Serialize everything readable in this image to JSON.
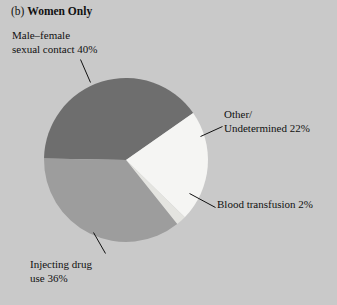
{
  "figure": {
    "panel_tag": "(b)",
    "title": "Women Only",
    "background_color": "#c9c9c9"
  },
  "chart_data": {
    "type": "pie",
    "title": "(b) Women Only",
    "xlabel": "",
    "ylabel": "",
    "legend_position": "none",
    "grid": false,
    "units": "percent",
    "total": 100,
    "categories": [
      "Male–female sexual contact",
      "Other/Undetermined",
      "Blood transfusion",
      "Injecting drug use"
    ],
    "values": [
      40,
      22,
      2,
      36
    ],
    "slices": [
      {
        "name": "Male–female sexual contact",
        "value": 40,
        "label_line1": "Male–female",
        "label_line2": "sexual contact 40%",
        "color": "#6e6e6e",
        "start_angle": 271,
        "end_angle": 415
      },
      {
        "name": "Other/Undetermined",
        "value": 22,
        "label_line1": "Other/",
        "label_line2": "Undetermined 22%",
        "color": "#f5f5f3",
        "start_angle": 31,
        "end_angle": 110
      },
      {
        "name": "Blood transfusion",
        "value": 2,
        "label_line1": "Blood transfusion 2%",
        "label_line2": "",
        "color": "#e4e4e0",
        "start_angle": 110,
        "end_angle": 117
      },
      {
        "name": "Injecting drug use",
        "value": 36,
        "label_line1": "Injecting drug",
        "label_line2": "use 36%",
        "color": "#9d9d9d",
        "start_angle": 117,
        "end_angle": 271
      }
    ]
  }
}
